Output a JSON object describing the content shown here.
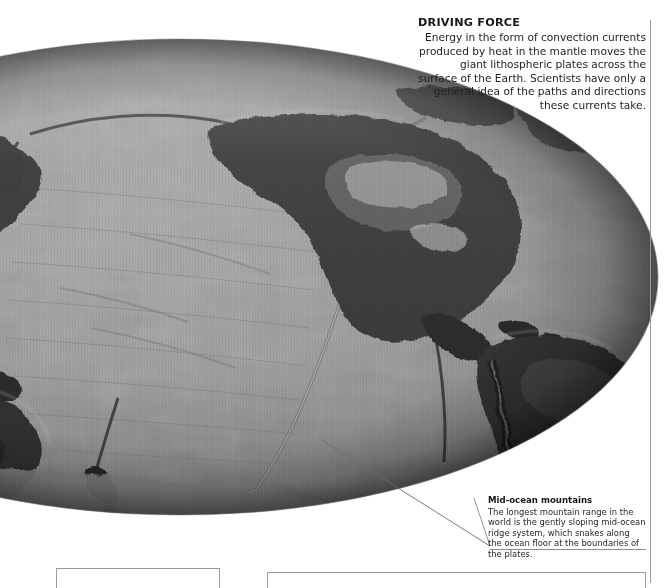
{
  "page": {
    "background_color": "#ffffff",
    "width": 668,
    "height": 583
  },
  "map": {
    "name": "world-relief-map",
    "projection": "elliptical",
    "centered_on": "Pacific Ocean",
    "style": "grayscale shaded relief with ocean floor bathymetry",
    "ocean_color": "#9a9a9a",
    "land_color": "#3a3a3a",
    "limb_shadow_color": "#5e5e5e",
    "highland_highlight_color": "#d6d6d6"
  },
  "annotations": {
    "driving_force": {
      "title": "DRIVING FORCE",
      "body": "Energy in the form of convection currents produced by heat in the mantle moves the giant lithospheric plates across the surface of the Earth. Scientists have only a general idea of the paths and directions these currents take."
    },
    "mid_ocean_mountains": {
      "title": "Mid-ocean mountains",
      "body": "The longest mountain range in the world is the gently sloping mid-ocean ridge system, which snakes along the ocean floor at the boundaries of the plates."
    }
  },
  "rules": {
    "vertical_rule_color": "#9a9a9a",
    "leader_line_color": "#6b6b6b",
    "caption_underline_color": "#8e8e8e"
  },
  "panels": {
    "left_panel_border_color": "#9c9c9c",
    "right_panel_border_color": "#9c9c9c"
  }
}
